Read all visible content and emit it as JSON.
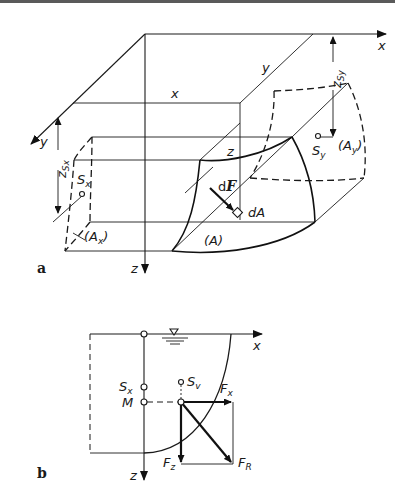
{
  "figure_a": {
    "panel_label": "a",
    "axes": {
      "x": "x",
      "y": "y",
      "z": "z"
    },
    "edge_labels": {
      "x": "x",
      "y": "y",
      "z": "z"
    },
    "dimensions": {
      "z_sx": "z",
      "z_sx_sub": "Sx",
      "z_sy": "z",
      "z_sy_sub": "Sy"
    },
    "points": {
      "s_x": "S",
      "s_x_sub": "x",
      "s_y": "S",
      "s_y_sub": "y"
    },
    "areas": {
      "a_x": "(A",
      "a_x_sub": "x",
      "a_x_close": ")",
      "a_y": "(A",
      "a_y_sub": "y",
      "a_y_close": ")",
      "a": "(A)",
      "dA": "dA"
    },
    "force": {
      "d": "d",
      "F": "F"
    }
  },
  "figure_b": {
    "panel_label": "b",
    "axes": {
      "x": "x",
      "z": "z"
    },
    "points": {
      "s_x": "S",
      "s_x_sub": "x",
      "m": "M",
      "s_v": "S",
      "s_v_sub": "v"
    },
    "forces": {
      "fx": "F",
      "fx_sub": "x",
      "fz": "F",
      "fz_sub": "z",
      "fr": "F",
      "fr_sub": "R"
    },
    "water_surface_symbol": "▽"
  }
}
